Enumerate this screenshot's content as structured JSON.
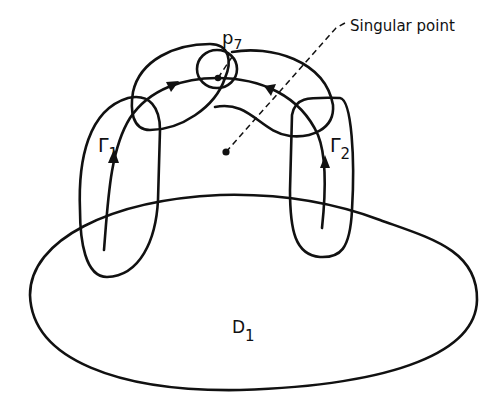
{
  "diagram": {
    "labels": {
      "p7": "p",
      "p7_sub": "7",
      "singular": "Singular point",
      "gamma1": "Γ",
      "gamma1_sub": "1",
      "gamma2": "Γ",
      "gamma2_sub": "2",
      "d1": "D",
      "d1_sub": "1"
    },
    "colors": {
      "ink": "#111111",
      "background": "#ffffff"
    }
  }
}
